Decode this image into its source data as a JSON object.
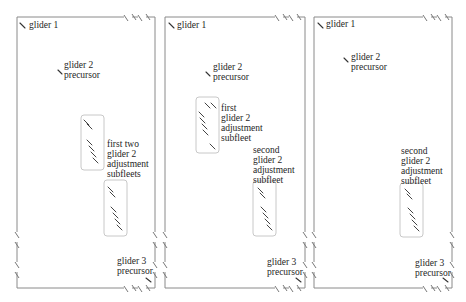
{
  "figure": {
    "type": "diagram",
    "colors": {
      "frame": "#8a8a8a",
      "box": "#c8c8c8",
      "glider": "#333333",
      "text": "#1e1e1e"
    }
  },
  "panels": [
    {
      "id": "panel-1",
      "labels": {
        "glider1": [
          "glider 1"
        ],
        "glider2": [
          "glider 2",
          "precursor"
        ],
        "subfleet": [
          "first two",
          "glider 2",
          "adjustment",
          "subfleets"
        ],
        "glider3": [
          "glider 3",
          "precursor"
        ]
      }
    },
    {
      "id": "panel-2",
      "labels": {
        "glider1": [
          "glider 1"
        ],
        "glider2": [
          "glider 2",
          "precursor"
        ],
        "subfleet_first": [
          "first",
          "glider 2",
          "adjustment",
          "subfleet"
        ],
        "subfleet_second": [
          "second",
          "glider 2",
          "adjustment",
          "subfleet"
        ],
        "glider3": [
          "glider 3",
          "precursor"
        ]
      }
    },
    {
      "id": "panel-3",
      "labels": {
        "glider1": [
          "glider 1"
        ],
        "glider2": [
          "glider 2",
          "precursor"
        ],
        "subfleet_second": [
          "second",
          "glider 2",
          "adjustment",
          "subfleet"
        ],
        "glider3": [
          "glider 3",
          "precursor"
        ]
      }
    }
  ]
}
